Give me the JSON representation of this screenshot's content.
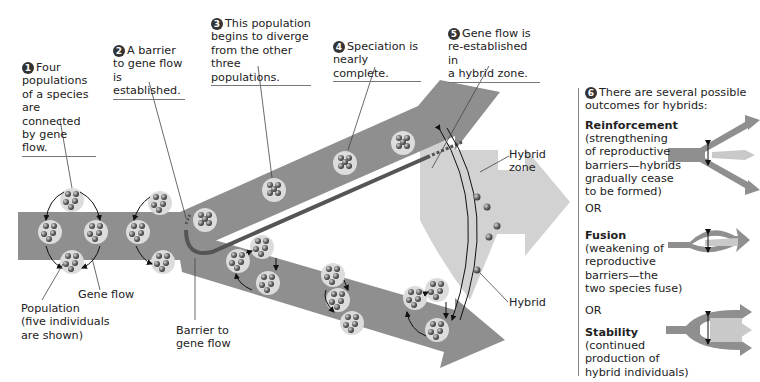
{
  "steps": [
    {
      "number": "1",
      "text_lines": [
        "Four",
        "populations",
        "of a species",
        "are connected",
        "by gene flow."
      ]
    },
    {
      "number": "2",
      "text_lines": [
        "A barrier",
        "to gene flow",
        "is established."
      ]
    },
    {
      "number": "3",
      "text_lines": [
        "This population",
        "begins to diverge",
        "from the other",
        "three populations."
      ]
    },
    {
      "number": "4",
      "text_lines": [
        "Speciation is",
        "nearly complete."
      ]
    },
    {
      "number": "5",
      "text_lines": [
        "Gene flow is",
        "re-established in",
        "a hybrid zone."
      ]
    },
    {
      "number": "6",
      "text_lines": [
        "There are several possible",
        "outcomes for hybrids:"
      ]
    }
  ],
  "labels": {
    "population": [
      "Population",
      "(five individuals",
      "are shown)"
    ],
    "gene_flow": "Gene flow",
    "barrier": [
      "Barrier to",
      "gene flow"
    ],
    "hybrid_zone": [
      "Hybrid",
      "zone"
    ],
    "hybrid": "Hybrid"
  },
  "outcomes": [
    {
      "title": "Reinforcement",
      "desc_lines": [
        "(strengthening",
        "of reproductive",
        "barriers—hybrids",
        "gradually cease",
        "to be formed)"
      ]
    },
    {
      "title": "Fusion",
      "desc_lines": [
        "(weakening of",
        "reproductive",
        "barriers—the",
        "two species fuse)"
      ]
    },
    {
      "title": "Stability",
      "desc_lines": [
        "(continued",
        "production of",
        "hybrid individuals)"
      ]
    }
  ],
  "separator": "OR",
  "colors": {
    "arrow": "#8f8f8f",
    "hybrid_zone": "#d2d2d2",
    "population_disc": "#dcdcdc",
    "barrier": "#555555",
    "individual": "#6a6a6a"
  }
}
